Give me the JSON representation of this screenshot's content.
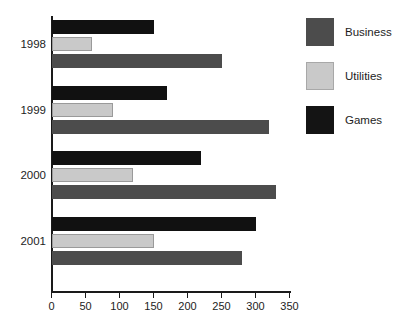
{
  "chart_data": {
    "type": "bar",
    "orientation": "horizontal",
    "title": "",
    "xlabel": "",
    "ylabel": "",
    "xlim": [
      0,
      350
    ],
    "xticks": [
      0,
      50,
      100,
      150,
      200,
      250,
      300,
      350
    ],
    "categories": [
      "1998",
      "1999",
      "2000",
      "2001"
    ],
    "grid": false,
    "legend_position": "right",
    "series": [
      {
        "name": "Business",
        "color": "#4c4c4c",
        "values": [
          250,
          320,
          330,
          280
        ]
      },
      {
        "name": "Utilities",
        "color": "#c9c9c9",
        "values": [
          60,
          90,
          120,
          150
        ]
      },
      {
        "name": "Games",
        "color": "#141414",
        "values": [
          150,
          170,
          220,
          300
        ]
      }
    ]
  },
  "legend": {
    "items": [
      {
        "label": "Business",
        "swatch": "business"
      },
      {
        "label": "Utilities",
        "swatch": "utilities"
      },
      {
        "label": "Games",
        "swatch": "games"
      }
    ]
  }
}
